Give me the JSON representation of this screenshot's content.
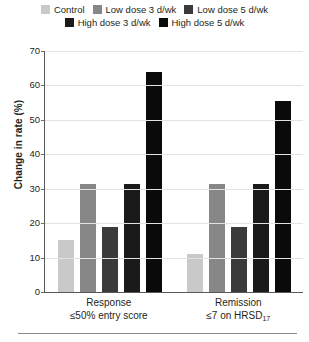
{
  "chart_data": {
    "type": "bar",
    "title": "",
    "xlabel": "",
    "ylabel": "Change in rate (%)",
    "ylim": [
      0,
      70
    ],
    "ytick_step": 10,
    "yticks": [
      0,
      10,
      20,
      30,
      40,
      50,
      60,
      70
    ],
    "grid": true,
    "legend_position": "top",
    "categories": [
      "Response\n≤50% entry score",
      "Remission\n≤7 on HRSD₁₇"
    ],
    "category_lines": [
      {
        "line1": "Response",
        "line2": "≤50% entry score"
      },
      {
        "line1": "Remission",
        "line2_prefix": "≤7 on HRSD",
        "line2_sub": "17"
      }
    ],
    "series": [
      {
        "name": "Control",
        "color": "#c9c9c9",
        "values": [
          15,
          11
        ]
      },
      {
        "name": "Low dose 3 d/wk",
        "color": "#878787",
        "values": [
          31.5,
          31.5
        ]
      },
      {
        "name": "Low dose 5 d/wk",
        "color": "#3a3a3a",
        "values": [
          19,
          19
        ]
      },
      {
        "name": "High dose 3 d/wk",
        "color": "#1a1a1a",
        "values": [
          31.5,
          31.5
        ]
      },
      {
        "name": "High dose 5 d/wk",
        "color": "#0a0a0a",
        "values": [
          64,
          55.5
        ]
      }
    ]
  },
  "legend": {
    "row1": [
      {
        "label": "Control",
        "color": "#c9c9c9"
      },
      {
        "label": "Low dose 3 d/wk",
        "color": "#878787"
      },
      {
        "label": "Low dose 5 d/wk",
        "color": "#3a3a3a"
      }
    ],
    "row2": [
      {
        "label": "High dose 3 d/wk",
        "color": "#1a1a1a"
      },
      {
        "label": "High dose 5 d/wk",
        "color": "#0a0a0a"
      }
    ]
  },
  "axis": {
    "y_title": "Change in rate (%)",
    "y_tick_labels": [
      "70",
      "60",
      "50",
      "40",
      "30",
      "20",
      "10",
      "0"
    ]
  }
}
